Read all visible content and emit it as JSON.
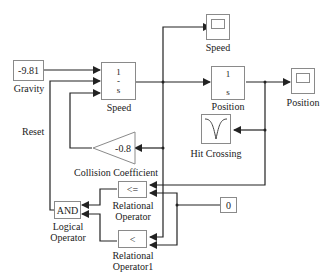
{
  "diagram": {
    "type": "simulink-block-diagram",
    "blocks": {
      "gravity": {
        "value": "-9.81",
        "label": "Gravity"
      },
      "speed_integrator": {
        "numerator": "1",
        "denominator": "s",
        "label": "Speed"
      },
      "position_integrator": {
        "numerator": "1",
        "denominator": "s",
        "label": "Position"
      },
      "speed_scope": {
        "label": "Speed"
      },
      "position_scope": {
        "label": "Position"
      },
      "hit_crossing": {
        "label": "Hit Crossing"
      },
      "collision_gain": {
        "value": "-0.8",
        "label": "Collision Coefficient"
      },
      "relational_op": {
        "operator": "<=",
        "label_line1": "Relational",
        "label_line2": "Operator"
      },
      "relational_op1": {
        "operator": "<",
        "label_line1": "Relational",
        "label_line2": "Operator1"
      },
      "logical_op": {
        "operator": "AND",
        "label_line1": "Logical",
        "label_line2": "Operator"
      },
      "constant_zero": {
        "value": "0"
      }
    },
    "annotations": {
      "reset": "Reset"
    },
    "colors": {
      "line": "#222222",
      "block_border": "#8a8a8a",
      "background": "#ffffff"
    }
  }
}
